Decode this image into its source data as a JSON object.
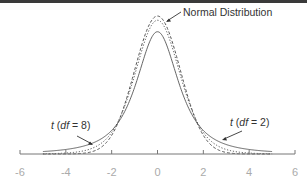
{
  "chart_data": {
    "type": "line",
    "title": "",
    "xlabel": "",
    "ylabel": "",
    "xlim": [
      -6,
      6
    ],
    "x_ticks": [
      -6,
      -4,
      -2,
      0,
      2,
      4,
      6
    ],
    "x_tick_labels": [
      "-6",
      "-4",
      "-2",
      "0",
      "2",
      "4",
      "6"
    ],
    "grid": false,
    "legend": "none (inline annotations)",
    "series": [
      {
        "name": "Normal Distribution",
        "style": "dashed",
        "peak": 0.399,
        "x": [
          -6,
          -4,
          -3,
          -2,
          -1,
          0,
          1,
          2,
          3,
          4,
          6
        ],
        "y": [
          0.0,
          0.0001,
          0.0044,
          0.054,
          0.242,
          0.399,
          0.242,
          0.054,
          0.0044,
          0.0001,
          0.0
        ]
      },
      {
        "name": "t (df = 8)",
        "style": "dotted",
        "peak": 0.387,
        "x": [
          -6,
          -4,
          -3,
          -2,
          -1,
          0,
          1,
          2,
          3,
          4,
          6
        ],
        "y": [
          0.0006,
          0.0034,
          0.0171,
          0.0644,
          0.2276,
          0.3867,
          0.2276,
          0.0644,
          0.0171,
          0.0034,
          0.0006
        ]
      },
      {
        "name": "t (df = 2)",
        "style": "solid",
        "peak": 0.354,
        "x": [
          -6,
          -4,
          -3,
          -2,
          -1,
          0,
          1,
          2,
          3,
          4,
          6
        ],
        "y": [
          0.0042,
          0.0131,
          0.0274,
          0.068,
          0.1925,
          0.3536,
          0.1925,
          0.068,
          0.0274,
          0.0131,
          0.0042
        ]
      }
    ],
    "annotations": [
      {
        "text": "Normal Distribution",
        "points_to": "Normal Distribution curve near peak"
      },
      {
        "text_prefix": "t",
        "text_suffix": " (df = 8)",
        "points_to": "t (df = 8) curve, left tail"
      },
      {
        "text_prefix": "t",
        "text_suffix": " (df = 2)",
        "points_to": "t (df = 2) curve, right tail"
      }
    ]
  },
  "labels": {
    "normal": "Normal Distribution",
    "t8_italic_t": "t",
    "t8_open": " (",
    "t8_df": "df",
    "t8_close": " = 8)",
    "t2_italic_t": "t",
    "t2_open": " (",
    "t2_df": "df",
    "t2_close": " = 2)"
  },
  "axis": {
    "ticks": [
      "-6",
      "-4",
      "-2",
      "0",
      "2",
      "4",
      "6"
    ]
  }
}
